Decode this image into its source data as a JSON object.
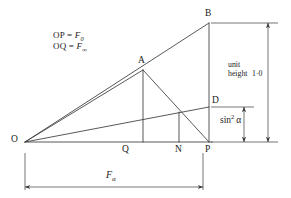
{
  "figure": {
    "background_color": "#ffffff",
    "line_color": "#3a3a3a",
    "text_color": "#1a1a1a"
  },
  "annotations": {
    "formula_line_1_lhs": "OP = ",
    "formula_line_1_var": "F",
    "formula_line_1_sub": "0",
    "formula_line_2_lhs": "OQ = ",
    "formula_line_2_var": "F",
    "formula_line_2_sub": "∞",
    "unit_height_line_1": "unit",
    "unit_height_line_2": "height",
    "unit_height_value": "1·0",
    "sin_squared_base": "sin",
    "sin_squared_exponent": "2",
    "sin_squared_angle": "α",
    "f_alpha_var": "F",
    "f_alpha_sub": "α"
  },
  "points": [
    {
      "name": "O",
      "label": "O",
      "x": 25,
      "y": 142
    },
    {
      "name": "Q",
      "label": "Q",
      "x": 126,
      "y": 142
    },
    {
      "name": "N",
      "label": "N",
      "x": 179,
      "y": 142
    },
    {
      "name": "P",
      "label": "P",
      "x": 209,
      "y": 142
    },
    {
      "name": "A",
      "label": "A",
      "x": 143,
      "y": 70
    },
    {
      "name": "B",
      "label": "B",
      "x": 209,
      "y": 23
    },
    {
      "name": "D",
      "label": "D",
      "x": 209,
      "y": 107
    }
  ],
  "segments": [
    {
      "name": "baseline-O-P",
      "from": "O",
      "to": "P"
    },
    {
      "name": "hypotenuse-O-B",
      "from": "O",
      "to": "B"
    },
    {
      "name": "vertical-B-P",
      "from": "B",
      "to": "P"
    },
    {
      "name": "chord-O-A",
      "from": "O",
      "to": "A"
    },
    {
      "name": "altitude-A-Q",
      "from": "A",
      "to": "Q"
    },
    {
      "name": "chord-A-P",
      "from": "A",
      "to": "P"
    },
    {
      "name": "chord-O-D",
      "from": "O",
      "to": "D"
    },
    {
      "name": "altitude-N-line",
      "from": "N",
      "to": "N-on-OD"
    }
  ],
  "dimensions": [
    {
      "name": "unit-height-dimension",
      "orientation": "vertical",
      "label": "unit height 1·0",
      "from_y": 23,
      "to_y": 142,
      "x": 268
    },
    {
      "name": "sin-squared-dimension",
      "orientation": "vertical",
      "label": "sin² α",
      "from_y": 107,
      "to_y": 142,
      "x": 244
    },
    {
      "name": "f-alpha-dimension",
      "orientation": "horizontal",
      "label": "Fα",
      "from_x": 25,
      "to_x": 203,
      "y": 187
    }
  ]
}
